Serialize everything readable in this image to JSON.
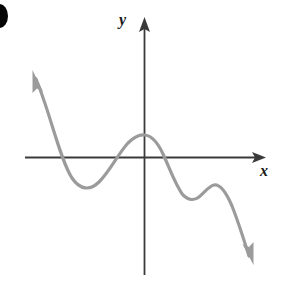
{
  "figure": {
    "name": "polynomial-graph-sketch",
    "bullet_marker": "filled-circle-bullet",
    "background_color": "#ffffff"
  },
  "axes": {
    "x_label": "x",
    "y_label": "y",
    "axis_color": "#3a3a3a",
    "x_axis": {
      "y_pixel": 157,
      "x_start": 25,
      "x_end": 265,
      "arrow": "right-arrowhead"
    },
    "y_axis": {
      "x_pixel": 144,
      "y_start": 275,
      "y_end": 18,
      "arrow": "up-arrowhead"
    },
    "origin": {
      "x": 144,
      "y": 157
    }
  },
  "curve": {
    "name": "degree-five-polynomial-curve",
    "color": "#9b9b9b",
    "stroke_width": 3.2,
    "end_behavior_left": "up",
    "end_behavior_right": "down",
    "left_arrow": "up-left-arrowhead",
    "right_arrow": "down-right-arrowhead",
    "path": "M 36 79 C 50 112, 60 160, 72 178 C 80 190, 90 191, 99 182 C 110 171, 118 154, 128 143 C 134 137, 140 134, 145 135 C 152 136, 158 143, 163 154 C 170 169, 176 186, 183 195 C 188 200, 194 201, 199 197 C 205 192, 209 186, 214 185 C 220 184, 226 192, 232 206 C 238 221, 244 240, 249 256",
    "left_arrow_points": "33,71 41,89 36,87 32,91",
    "right_arrow_points": "253,264 244,247 248,250 252,245",
    "turning_points": [
      {
        "name": "local-minimum-left",
        "x": 83,
        "y": 187
      },
      {
        "name": "local-maximum-center",
        "x": 145,
        "y": 134
      },
      {
        "name": "local-minimum-right",
        "x": 186,
        "y": 199
      },
      {
        "name": "local-maximum-right",
        "x": 213,
        "y": 185
      }
    ],
    "x_intercepts": [
      {
        "name": "x-intercept-left",
        "x": 59
      },
      {
        "name": "x-intercept-middle",
        "x": 113
      },
      {
        "name": "x-intercept-right",
        "x": 165
      }
    ]
  },
  "chart_data": {
    "type": "line",
    "title": "",
    "xlabel": "x",
    "ylabel": "y",
    "grid": false,
    "legend": null,
    "series": [
      {
        "name": "polynomial",
        "description": "Smooth curve rising to upper-left, falling to lower-right, with four turning points and three x-intercepts",
        "points": [
          {
            "x": -4.4,
            "y": 3.9
          },
          {
            "x": -3.6,
            "y": 1.8
          },
          {
            "x": -2.9,
            "y": 0.0
          },
          {
            "x": -2.1,
            "y": -1.5
          },
          {
            "x": -1.1,
            "y": -1.0
          },
          {
            "x": -0.5,
            "y": 0.0
          },
          {
            "x": 0.0,
            "y": 1.2
          },
          {
            "x": 0.5,
            "y": 0.7
          },
          {
            "x": 1.0,
            "y": 0.0
          },
          {
            "x": 1.6,
            "y": -1.5
          },
          {
            "x": 2.2,
            "y": -1.3
          },
          {
            "x": 2.8,
            "y": -1.0
          },
          {
            "x": 3.5,
            "y": -2.0
          },
          {
            "x": 4.2,
            "y": -3.8
          }
        ]
      }
    ],
    "xlim": [
      -5.0,
      4.8
    ],
    "ylim": [
      -4.5,
      4.5
    ]
  }
}
